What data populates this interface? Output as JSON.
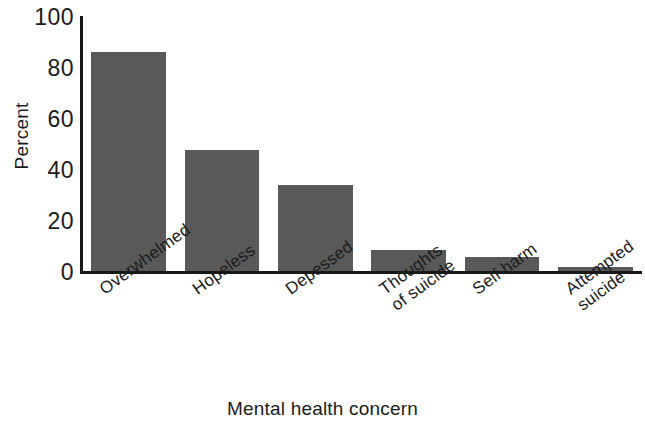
{
  "chart_data": {
    "type": "bar",
    "title": "",
    "subtitle": "",
    "xlabel": "Mental health concern",
    "ylabel": "Percent",
    "categories": [
      "Overwhelmed",
      "Hopeless",
      "Depessed",
      "Thoughts\nof suicide",
      "Self harm",
      "Attempted\nsuicide"
    ],
    "values": [
      87,
      48,
      34,
      8.5,
      5.5,
      1.5
    ],
    "ylim": [
      0,
      100
    ],
    "yticks": [
      100,
      80,
      60,
      40,
      20,
      0
    ],
    "ytick_labels": [
      "100",
      "80",
      "60",
      "40",
      "20",
      "0"
    ],
    "grid": false,
    "legend": "none",
    "bar_color": "#595959",
    "axis_color": "#171717",
    "background": "#ffffff"
  },
  "axis": {
    "y_title": "Percent",
    "x_title": "Mental health concern"
  }
}
